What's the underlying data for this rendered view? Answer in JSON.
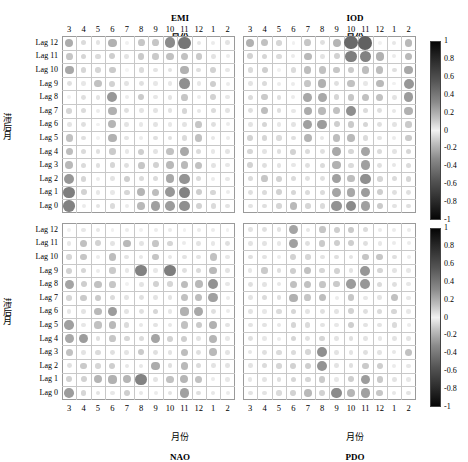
{
  "figure": {
    "title_top_left": "EMI",
    "title_top_right": "IOD",
    "month_label": "月份",
    "bottom_left_name": "NAO",
    "bottom_right_name": "PDO",
    "y_axis_label": "滞后月",
    "row_labels": [
      "Lag 12",
      "Lag 11",
      "Lag 10",
      "Lag 9",
      "Lag 8",
      "Lag 7",
      "Lag 6",
      "Lag 5",
      "Lag 4",
      "Lag 3",
      "Lag 2",
      "Lag 1",
      "Lag 0"
    ],
    "x_tick_labels": [
      "3",
      "4",
      "5",
      "6",
      "7",
      "8",
      "9",
      "10",
      "11",
      "12",
      "1",
      "2"
    ],
    "colorbar_ticks": [
      "1",
      "0.8",
      "0.6",
      "0.4",
      "0.2",
      "0",
      "-0.2",
      "-0.4",
      "-0.6",
      "-0.8",
      "-1"
    ],
    "colorbar_min": -1,
    "colorbar_max": 1,
    "accent_color": "#000000",
    "grid_line_color": "#c8c8c8",
    "border_color": "#9a9a9a"
  },
  "chart_data": [
    {
      "type": "heatmap",
      "panel": "EMI",
      "title": "EMI",
      "xlabel": "月份",
      "ylabel": "滞后月",
      "x": [
        "3",
        "4",
        "5",
        "6",
        "7",
        "8",
        "9",
        "10",
        "11",
        "12",
        "1",
        "2"
      ],
      "y": [
        "Lag 12",
        "Lag 11",
        "Lag 10",
        "Lag 9",
        "Lag 8",
        "Lag 7",
        "Lag 6",
        "Lag 5",
        "Lag 4",
        "Lag 3",
        "Lag 2",
        "Lag 1",
        "Lag 0"
      ],
      "zlim": [
        -1,
        1
      ],
      "grid": true,
      "legend": "right colorbar",
      "values": [
        [
          0.36,
          0.14,
          0.1,
          0.34,
          0.04,
          0.24,
          0.24,
          0.52,
          0.62,
          0.08,
          0.06,
          0.1
        ],
        [
          0.24,
          0.16,
          0.14,
          0.2,
          0.1,
          0.22,
          0.22,
          0.26,
          0.26,
          0.22,
          0.1,
          0.06
        ],
        [
          0.38,
          0.16,
          0.16,
          0.22,
          0.02,
          0.14,
          0.1,
          0.1,
          0.34,
          0.12,
          0.18,
          0.08
        ],
        [
          0.12,
          0.08,
          0.26,
          0.18,
          0.1,
          0.12,
          0.08,
          0.08,
          0.5,
          0.08,
          0.2,
          0.06
        ],
        [
          0.04,
          0.12,
          0.1,
          0.46,
          0.06,
          0.22,
          0.08,
          0.1,
          0.24,
          0.06,
          0.18,
          0.08
        ],
        [
          0.16,
          0.14,
          0.06,
          0.34,
          0.12,
          0.1,
          0.1,
          0.1,
          0.16,
          0.08,
          0.14,
          0.1
        ],
        [
          0.1,
          0.12,
          0.04,
          0.32,
          0.1,
          0.08,
          0.1,
          0.08,
          0.1,
          0.24,
          0.12,
          0.06
        ],
        [
          0.26,
          0.12,
          0.04,
          0.34,
          0.1,
          0.06,
          0.12,
          0.12,
          0.14,
          0.26,
          0.08,
          0.06
        ],
        [
          0.28,
          0.14,
          0.12,
          0.22,
          0.08,
          0.2,
          0.1,
          0.26,
          0.38,
          0.14,
          0.08,
          0.1
        ],
        [
          0.3,
          0.14,
          0.12,
          0.16,
          0.12,
          0.24,
          0.18,
          0.3,
          0.3,
          0.26,
          0.1,
          0.08
        ],
        [
          0.46,
          0.16,
          0.06,
          0.1,
          0.2,
          0.14,
          0.14,
          0.38,
          0.48,
          0.14,
          0.06,
          0.08
        ],
        [
          0.58,
          0.18,
          0.08,
          0.08,
          0.16,
          0.32,
          0.28,
          0.46,
          0.56,
          0.2,
          0.16,
          0.06
        ],
        [
          0.56,
          0.06,
          0.1,
          0.14,
          0.06,
          0.3,
          0.42,
          0.44,
          0.5,
          0.18,
          0.14,
          0.1
        ]
      ]
    },
    {
      "type": "heatmap",
      "panel": "IOD",
      "title": "IOD",
      "xlabel": "月份",
      "ylabel": "滞后月",
      "x": [
        "3",
        "4",
        "5",
        "6",
        "7",
        "8",
        "9",
        "10",
        "11",
        "12",
        "1",
        "2"
      ],
      "y": [
        "Lag 12",
        "Lag 11",
        "Lag 10",
        "Lag 9",
        "Lag 8",
        "Lag 7",
        "Lag 6",
        "Lag 5",
        "Lag 4",
        "Lag 3",
        "Lag 2",
        "Lag 1",
        "Lag 0"
      ],
      "zlim": [
        -1,
        1
      ],
      "grid": true,
      "legend": "right colorbar",
      "values": [
        [
          0.34,
          0.26,
          0.16,
          0.04,
          0.24,
          0.12,
          0.32,
          0.68,
          0.72,
          0.04,
          0.08,
          0.3
        ],
        [
          0.18,
          0.16,
          0.14,
          0.06,
          0.3,
          0.1,
          0.18,
          0.58,
          0.56,
          0.34,
          0.06,
          0.3
        ],
        [
          0.14,
          0.2,
          0.04,
          0.14,
          0.28,
          0.26,
          0.24,
          0.22,
          0.28,
          0.28,
          0.12,
          0.38
        ],
        [
          0.1,
          0.14,
          0.06,
          0.06,
          0.24,
          0.34,
          0.12,
          0.26,
          0.08,
          0.3,
          0.04,
          0.46
        ],
        [
          0.14,
          0.22,
          0.12,
          0.06,
          0.38,
          0.38,
          0.16,
          0.24,
          0.26,
          0.26,
          0.1,
          0.44
        ],
        [
          0.12,
          0.28,
          0.12,
          0.08,
          0.36,
          0.3,
          0.26,
          0.5,
          0.14,
          0.12,
          0.08,
          0.34
        ],
        [
          0.1,
          0.16,
          0.08,
          0.1,
          0.42,
          0.44,
          0.2,
          0.22,
          0.16,
          0.12,
          0.1,
          0.22
        ],
        [
          0.18,
          0.16,
          0.14,
          0.12,
          0.32,
          0.08,
          0.28,
          0.3,
          0.14,
          0.1,
          0.06,
          0.22
        ],
        [
          0.16,
          0.1,
          0.12,
          0.18,
          0.14,
          0.12,
          0.38,
          0.16,
          0.4,
          0.14,
          0.1,
          0.16
        ],
        [
          0.18,
          0.12,
          0.1,
          0.08,
          0.12,
          0.14,
          0.34,
          0.14,
          0.42,
          0.12,
          0.08,
          0.14
        ],
        [
          0.14,
          0.24,
          0.18,
          0.14,
          0.12,
          0.12,
          0.42,
          0.28,
          0.5,
          0.16,
          0.14,
          0.16
        ],
        [
          0.12,
          0.14,
          0.18,
          0.16,
          0.14,
          0.14,
          0.4,
          0.38,
          0.44,
          0.2,
          0.12,
          0.12
        ],
        [
          0.1,
          0.12,
          0.16,
          0.3,
          0.16,
          0.14,
          0.48,
          0.52,
          0.42,
          0.22,
          0.1,
          0.12
        ]
      ]
    },
    {
      "type": "heatmap",
      "panel": "NAO",
      "title": "NAO",
      "xlabel": "月份",
      "ylabel": "滞后月",
      "x": [
        "3",
        "4",
        "5",
        "6",
        "7",
        "8",
        "9",
        "10",
        "11",
        "12",
        "1",
        "2"
      ],
      "y": [
        "Lag 12",
        "Lag 11",
        "Lag 10",
        "Lag 9",
        "Lag 8",
        "Lag 7",
        "Lag 6",
        "Lag 5",
        "Lag 4",
        "Lag 3",
        "Lag 2",
        "Lag 1",
        "Lag 0"
      ],
      "zlim": [
        -1,
        1
      ],
      "grid": true,
      "legend": "right colorbar",
      "values": [
        [
          0.04,
          0.08,
          0.08,
          0.04,
          0.06,
          0.04,
          0.06,
          0.06,
          0.04,
          0.06,
          0.06,
          0.04
        ],
        [
          0.08,
          0.26,
          0.18,
          0.1,
          0.3,
          0.1,
          0.24,
          0.16,
          0.06,
          0.1,
          0.08,
          0.12
        ],
        [
          0.16,
          0.24,
          0.06,
          0.28,
          0.1,
          0.08,
          0.24,
          0.08,
          0.1,
          0.1,
          0.26,
          0.08
        ],
        [
          0.18,
          0.16,
          0.06,
          0.22,
          0.08,
          0.56,
          0.08,
          0.58,
          0.12,
          0.14,
          0.3,
          0.1
        ],
        [
          0.4,
          0.2,
          0.26,
          0.24,
          0.04,
          0.1,
          0.18,
          0.16,
          0.28,
          0.3,
          0.48,
          0.08
        ],
        [
          0.16,
          0.22,
          0.22,
          0.14,
          0.1,
          0.12,
          0.1,
          0.1,
          0.26,
          0.28,
          0.42,
          0.06
        ],
        [
          0.08,
          0.1,
          0.3,
          0.44,
          0.1,
          0.12,
          0.16,
          0.08,
          0.34,
          0.38,
          0.12,
          0.06
        ],
        [
          0.42,
          0.08,
          0.26,
          0.3,
          0.14,
          0.08,
          0.1,
          0.08,
          0.26,
          0.22,
          0.34,
          0.1
        ],
        [
          0.38,
          0.44,
          0.12,
          0.24,
          0.16,
          0.14,
          0.4,
          0.18,
          0.2,
          0.1,
          0.32,
          0.08
        ],
        [
          0.26,
          0.1,
          0.14,
          0.12,
          0.1,
          0.22,
          0.12,
          0.1,
          0.28,
          0.12,
          0.3,
          0.1
        ],
        [
          0.12,
          0.22,
          0.16,
          0.2,
          0.08,
          0.08,
          0.36,
          0.12,
          0.3,
          0.14,
          0.1,
          0.1
        ],
        [
          0.18,
          0.18,
          0.32,
          0.34,
          0.32,
          0.56,
          0.1,
          0.26,
          0.32,
          0.26,
          0.06,
          0.08
        ],
        [
          0.44,
          0.16,
          0.1,
          0.08,
          0.2,
          0.08,
          0.06,
          0.1,
          0.42,
          0.12,
          0.08,
          0.06
        ]
      ]
    },
    {
      "type": "heatmap",
      "panel": "PDO",
      "title": "PDO",
      "xlabel": "月份",
      "ylabel": "滞后月",
      "x": [
        "3",
        "4",
        "5",
        "6",
        "7",
        "8",
        "9",
        "10",
        "11",
        "12",
        "1",
        "2"
      ],
      "y": [
        "Lag 12",
        "Lag 11",
        "Lag 10",
        "Lag 9",
        "Lag 8",
        "Lag 7",
        "Lag 6",
        "Lag 5",
        "Lag 4",
        "Lag 3",
        "Lag 2",
        "Lag 1",
        "Lag 0"
      ],
      "zlim": [
        -1,
        1
      ],
      "grid": true,
      "legend": "right colorbar",
      "values": [
        [
          0.1,
          0.12,
          0.1,
          0.4,
          0.08,
          0.24,
          0.2,
          0.22,
          0.14,
          0.06,
          0.06,
          0.06
        ],
        [
          0.1,
          0.1,
          0.08,
          0.42,
          0.12,
          0.22,
          0.2,
          0.2,
          0.12,
          0.08,
          0.06,
          0.06
        ],
        [
          0.12,
          0.1,
          0.06,
          0.18,
          0.16,
          0.1,
          0.12,
          0.1,
          0.24,
          0.24,
          0.12,
          0.06
        ],
        [
          0.08,
          0.22,
          0.12,
          0.2,
          0.26,
          0.16,
          0.18,
          0.1,
          0.46,
          0.16,
          0.1,
          0.08
        ],
        [
          0.12,
          0.1,
          0.08,
          0.26,
          0.26,
          0.24,
          0.22,
          0.44,
          0.46,
          0.14,
          0.12,
          0.08
        ],
        [
          0.1,
          0.14,
          0.12,
          0.34,
          0.24,
          0.28,
          0.06,
          0.24,
          0.08,
          0.1,
          0.26,
          0.08
        ],
        [
          0.1,
          0.08,
          0.14,
          0.16,
          0.1,
          0.12,
          0.1,
          0.18,
          0.12,
          0.14,
          0.16,
          0.08
        ],
        [
          0.1,
          0.1,
          0.08,
          0.16,
          0.14,
          0.1,
          0.08,
          0.2,
          0.1,
          0.1,
          0.14,
          0.06
        ],
        [
          0.12,
          0.08,
          0.06,
          0.16,
          0.12,
          0.16,
          0.1,
          0.12,
          0.1,
          0.08,
          0.1,
          0.1
        ],
        [
          0.08,
          0.12,
          0.14,
          0.14,
          0.16,
          0.5,
          0.1,
          0.1,
          0.12,
          0.1,
          0.08,
          0.26
        ],
        [
          0.1,
          0.14,
          0.16,
          0.18,
          0.2,
          0.48,
          0.1,
          0.12,
          0.22,
          0.2,
          0.06,
          0.08
        ],
        [
          0.08,
          0.1,
          0.12,
          0.16,
          0.16,
          0.22,
          0.08,
          0.2,
          0.44,
          0.22,
          0.1,
          0.08
        ],
        [
          0.1,
          0.1,
          0.14,
          0.18,
          0.3,
          0.18,
          0.52,
          0.32,
          0.42,
          0.24,
          0.08,
          0.1
        ]
      ]
    }
  ]
}
